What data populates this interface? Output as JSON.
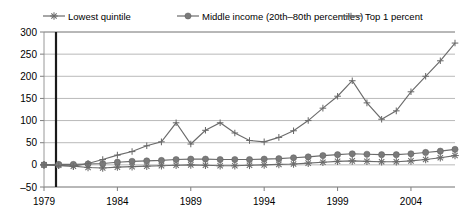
{
  "chart_data": {
    "type": "line",
    "title": "",
    "subtitle": "",
    "xlabel": "",
    "ylabel": "",
    "xlim": [
      1979,
      2007
    ],
    "ylim": [
      -50,
      300
    ],
    "yticks": [
      -50,
      0,
      50,
      100,
      150,
      200,
      250,
      300
    ],
    "ytick_labels": [
      "–50",
      "0",
      "50",
      "100",
      "150",
      "200",
      "250",
      "300"
    ],
    "xticks": [
      1979,
      1984,
      1989,
      1994,
      1999,
      2004
    ],
    "xtick_labels": [
      "1979",
      "1984",
      "1989",
      "1994",
      "1999",
      "2004"
    ],
    "grid": "horizontal",
    "legend_position": "top",
    "x": [
      1979,
      1980,
      1981,
      1982,
      1983,
      1984,
      1985,
      1986,
      1987,
      1988,
      1989,
      1990,
      1991,
      1992,
      1993,
      1994,
      1995,
      1996,
      1997,
      1998,
      1999,
      2000,
      2001,
      2002,
      2003,
      2004,
      2005,
      2006,
      2007
    ],
    "series": [
      {
        "name": "Lowest quintile",
        "marker": "asterisk",
        "values": [
          0,
          -1,
          -3,
          -6,
          -7,
          -5,
          -4,
          -3,
          -2,
          -1,
          0,
          -1,
          -2,
          -2,
          -1,
          0,
          1,
          2,
          4,
          6,
          8,
          9,
          8,
          7,
          7,
          9,
          12,
          16,
          21
        ]
      },
      {
        "name": "Middle income (20th–80th percentiles)",
        "marker": "circle",
        "values": [
          0,
          1,
          1,
          2,
          3,
          6,
          8,
          9,
          10,
          12,
          13,
          13,
          12,
          12,
          12,
          13,
          14,
          16,
          18,
          21,
          23,
          25,
          24,
          23,
          23,
          25,
          28,
          31,
          35
        ]
      },
      {
        "name": "Top 1 percent",
        "marker": "plus",
        "values": [
          0,
          -2,
          -3,
          3,
          12,
          22,
          30,
          43,
          52,
          95,
          47,
          78,
          95,
          72,
          55,
          52,
          62,
          77,
          100,
          128,
          155,
          190,
          140,
          103,
          122,
          165,
          200,
          235,
          275
        ]
      }
    ]
  },
  "legend": {
    "items": [
      {
        "label": "Lowest quintile",
        "marker": "asterisk"
      },
      {
        "label": "Middle income (20th–80th percentiles)",
        "marker": "circle"
      },
      {
        "label": "Top 1 percent",
        "marker": "plus"
      }
    ]
  },
  "colors": {
    "line": "#6b6b6b",
    "grid": "#9a9a9a",
    "origin": "#1a1a1a",
    "background": "#ffffff",
    "text": "#000000"
  }
}
